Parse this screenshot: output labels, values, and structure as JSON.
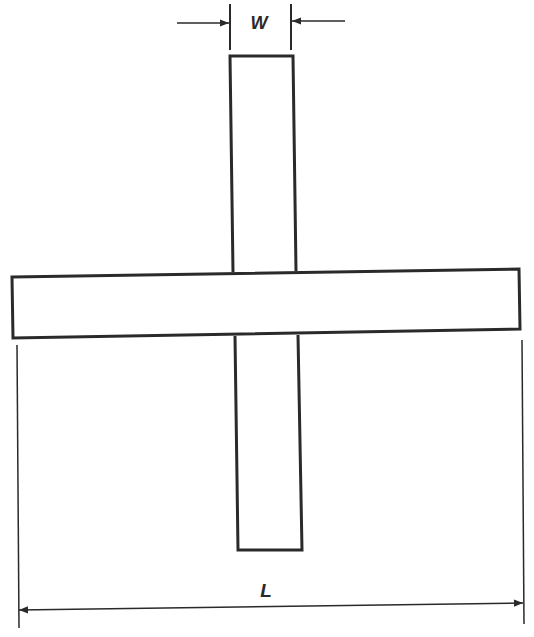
{
  "diagram": {
    "type": "cross-shaped structure with dimension annotations",
    "colors": {
      "stroke": "#2a2a2a",
      "background": "#ffffff"
    },
    "labels": {
      "width": "W",
      "length": "L"
    },
    "shapes": {
      "vertical_strip": "narrow vertical rectangle (width W)",
      "horizontal_bar": "long horizontal rectangle (length L)"
    }
  }
}
